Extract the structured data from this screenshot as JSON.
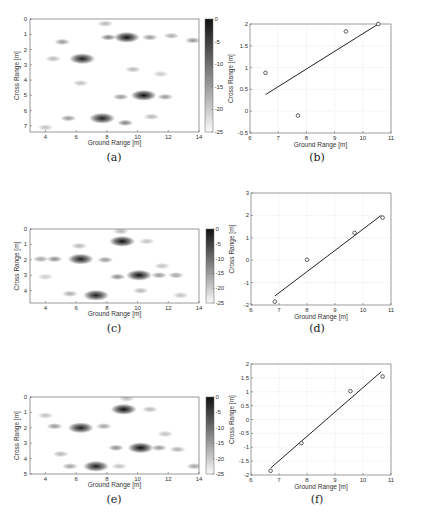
{
  "chart_data": [
    {
      "id": "a",
      "type": "heatmap",
      "caption": "(a)",
      "xlabel": "Ground Range [m]",
      "ylabel": "Cross Range [m]",
      "xlim": [
        3,
        14
      ],
      "ylim": [
        0,
        7.4
      ],
      "y_reversed": true,
      "xticks": [
        4,
        6,
        8,
        10,
        12,
        14
      ],
      "yticks": [
        0,
        1,
        2,
        3,
        4,
        5,
        6,
        7
      ],
      "colorbar": {
        "range": [
          -25,
          0
        ],
        "ticks": [
          0,
          -5,
          -10,
          -15,
          -20,
          -25
        ],
        "colormap": "gray-reversed"
      },
      "blobs": [
        {
          "x": 9.3,
          "y": 1.2,
          "level": 0
        },
        {
          "x": 6.4,
          "y": 2.6,
          "level": -1
        },
        {
          "x": 10.4,
          "y": 5.0,
          "level": 0
        },
        {
          "x": 7.7,
          "y": 6.5,
          "level": -1
        },
        {
          "x": 8.1,
          "y": 1.2,
          "level": -8
        },
        {
          "x": 10.8,
          "y": 1.2,
          "level": -10
        },
        {
          "x": 5.1,
          "y": 1.5,
          "level": -10
        },
        {
          "x": 13.6,
          "y": 1.4,
          "level": -10
        },
        {
          "x": 9.2,
          "y": 6.8,
          "level": -8
        },
        {
          "x": 11.8,
          "y": 5.1,
          "level": -10
        },
        {
          "x": 8.9,
          "y": 5.1,
          "level": -10
        },
        {
          "x": 5.5,
          "y": 6.5,
          "level": -10
        },
        {
          "x": 6.3,
          "y": 4.2,
          "level": -14
        },
        {
          "x": 9.7,
          "y": 3.3,
          "level": -13
        },
        {
          "x": 4.5,
          "y": 2.6,
          "level": -13
        },
        {
          "x": 12.2,
          "y": 1.1,
          "level": -12
        },
        {
          "x": 11.5,
          "y": 3.6,
          "level": -15
        },
        {
          "x": 7.9,
          "y": 0.3,
          "level": -13
        },
        {
          "x": 10.9,
          "y": 6.4,
          "level": -13
        },
        {
          "x": 4.0,
          "y": 7.1,
          "level": -14
        }
      ]
    },
    {
      "id": "b",
      "type": "scatter",
      "caption": "(b)",
      "xlabel": "Ground Range [m]",
      "ylabel": "Cross Range [m]",
      "xlim": [
        6,
        11
      ],
      "ylim": [
        -0.5,
        2
      ],
      "grid": true,
      "xticks": [
        6,
        7,
        8,
        9,
        10,
        11
      ],
      "yticks": [
        -0.5,
        0,
        0.5,
        1,
        1.5,
        2
      ],
      "points": [
        {
          "x": 6.55,
          "y": 0.88
        },
        {
          "x": 7.7,
          "y": -0.1
        },
        {
          "x": 9.4,
          "y": 1.83
        },
        {
          "x": 10.55,
          "y": 2.0
        }
      ],
      "fit_line": [
        {
          "x": 6.55,
          "y": 0.38
        },
        {
          "x": 10.55,
          "y": 2.0
        }
      ]
    },
    {
      "id": "c",
      "type": "heatmap",
      "caption": "(c)",
      "xlabel": "Ground Range [m]",
      "ylabel": "Cross Range [m]",
      "xlim": [
        3,
        14
      ],
      "ylim": [
        0,
        4.8
      ],
      "y_reversed": true,
      "xticks": [
        4,
        6,
        8,
        10,
        12,
        14
      ],
      "yticks": [
        0,
        1,
        2,
        3,
        4
      ],
      "colorbar": {
        "range": [
          -25,
          0
        ],
        "ticks": [
          0,
          -5,
          -10,
          -15,
          -20,
          -25
        ],
        "colormap": "gray-reversed"
      },
      "blobs": [
        {
          "x": 9.0,
          "y": 0.8,
          "level": 0
        },
        {
          "x": 6.3,
          "y": 1.95,
          "level": -1
        },
        {
          "x": 10.1,
          "y": 3.0,
          "level": 0
        },
        {
          "x": 7.3,
          "y": 4.3,
          "level": -1
        },
        {
          "x": 4.6,
          "y": 1.95,
          "level": -9
        },
        {
          "x": 3.7,
          "y": 1.95,
          "level": -11
        },
        {
          "x": 8.7,
          "y": 3.1,
          "level": -9
        },
        {
          "x": 11.4,
          "y": 3.0,
          "level": -10
        },
        {
          "x": 12.5,
          "y": 3.0,
          "level": -11
        },
        {
          "x": 5.6,
          "y": 4.2,
          "level": -12
        },
        {
          "x": 7.9,
          "y": 2.0,
          "level": -10
        },
        {
          "x": 10.6,
          "y": 0.8,
          "level": -14
        },
        {
          "x": 6.2,
          "y": 1.1,
          "level": -13
        },
        {
          "x": 11.6,
          "y": 2.4,
          "level": -14
        },
        {
          "x": 10.2,
          "y": 4.0,
          "level": -13
        },
        {
          "x": 4.0,
          "y": 3.1,
          "level": -15
        },
        {
          "x": 12.8,
          "y": 4.3,
          "level": -14
        },
        {
          "x": 8.9,
          "y": 0.15,
          "level": -13
        }
      ]
    },
    {
      "id": "d",
      "type": "scatter",
      "caption": "(d)",
      "xlabel": "Ground Range [m]",
      "ylabel": "Cross Range [m]",
      "xlim": [
        6,
        11
      ],
      "ylim": [
        -2,
        3
      ],
      "grid": true,
      "xticks": [
        6,
        7,
        8,
        9,
        10,
        11
      ],
      "yticks": [
        -2,
        -1,
        0,
        1,
        2,
        3
      ],
      "points": [
        {
          "x": 6.85,
          "y": -1.85
        },
        {
          "x": 8.0,
          "y": 0.02
        },
        {
          "x": 9.7,
          "y": 1.22
        },
        {
          "x": 10.7,
          "y": 1.9
        }
      ],
      "fit_line": [
        {
          "x": 6.85,
          "y": -1.6
        },
        {
          "x": 10.65,
          "y": 2.0
        }
      ]
    },
    {
      "id": "e",
      "type": "heatmap",
      "caption": "(e)",
      "xlabel": "Ground Range [m]",
      "ylabel": "Cross Range [m]",
      "xlim": [
        3,
        14
      ],
      "ylim": [
        0,
        5
      ],
      "y_reversed": true,
      "xticks": [
        4,
        6,
        8,
        10,
        12,
        14
      ],
      "yticks": [
        0,
        1,
        2,
        3,
        4,
        5
      ],
      "colorbar": {
        "range": [
          -25,
          0
        ],
        "ticks": [
          0,
          -5,
          -10,
          -15,
          -20,
          -25
        ],
        "colormap": "gray-reversed"
      },
      "blobs": [
        {
          "x": 9.1,
          "y": 0.8,
          "level": 0
        },
        {
          "x": 6.3,
          "y": 2.0,
          "level": -1
        },
        {
          "x": 10.2,
          "y": 3.3,
          "level": 0
        },
        {
          "x": 7.3,
          "y": 4.5,
          "level": -1
        },
        {
          "x": 4.6,
          "y": 1.9,
          "level": -10
        },
        {
          "x": 8.6,
          "y": 3.3,
          "level": -9
        },
        {
          "x": 11.4,
          "y": 3.3,
          "level": -10
        },
        {
          "x": 12.6,
          "y": 3.4,
          "level": -12
        },
        {
          "x": 5.6,
          "y": 4.5,
          "level": -11
        },
        {
          "x": 7.8,
          "y": 1.9,
          "level": -11
        },
        {
          "x": 10.8,
          "y": 0.8,
          "level": -13
        },
        {
          "x": 5.0,
          "y": 3.7,
          "level": -13
        },
        {
          "x": 11.8,
          "y": 2.4,
          "level": -14
        },
        {
          "x": 13.7,
          "y": 4.5,
          "level": -11
        },
        {
          "x": 8.8,
          "y": 4.5,
          "level": -14
        },
        {
          "x": 4.0,
          "y": 1.2,
          "level": -14
        },
        {
          "x": 9.3,
          "y": 0.1,
          "level": -14
        }
      ]
    },
    {
      "id": "f",
      "type": "scatter",
      "caption": "(f)",
      "xlabel": "Ground Range [m]",
      "ylabel": "Cross Range [m]",
      "xlim": [
        6,
        11
      ],
      "ylim": [
        -2,
        2
      ],
      "grid": true,
      "xticks": [
        6,
        7,
        8,
        9,
        10,
        11
      ],
      "yticks": [
        -2,
        -1.5,
        -1,
        -0.5,
        0,
        0.5,
        1,
        1.5,
        2
      ],
      "points": [
        {
          "x": 6.7,
          "y": -1.85
        },
        {
          "x": 7.8,
          "y": -0.85
        },
        {
          "x": 9.55,
          "y": 1.02
        },
        {
          "x": 10.7,
          "y": 1.55
        }
      ],
      "fit_line": [
        {
          "x": 6.7,
          "y": -1.75
        },
        {
          "x": 10.65,
          "y": 1.72
        }
      ]
    }
  ]
}
